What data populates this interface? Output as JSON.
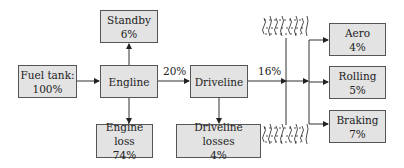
{
  "nodes": {
    "fuel_tank": {
      "label": "Fuel tank:",
      "value": "100%"
    },
    "engine": {
      "label": "Engline",
      "value": ""
    },
    "standby": {
      "label": "Standby",
      "value": "6%"
    },
    "engine_loss": {
      "label": "Engine loss",
      "value": "74%"
    },
    "driveline": {
      "label": "Driveline",
      "value": ""
    },
    "driveline_losses": {
      "label": "Driveline losses",
      "value": "4%"
    },
    "aero": {
      "label": "Aero",
      "value": "4%"
    },
    "rolling": {
      "label": "Rolling",
      "value": "5%"
    },
    "braking": {
      "label": "Braking",
      "value": "7%"
    }
  },
  "edges": {
    "engine_to_driveline": "20%",
    "driveline_to_wheels": "16%"
  },
  "colors": {
    "box_fill": "#e3e3e3",
    "box_border": "#555555",
    "line": "#333333"
  }
}
